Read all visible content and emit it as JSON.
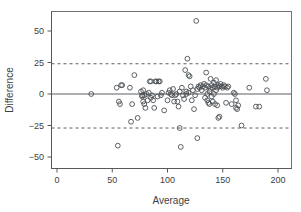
{
  "chart_data": {
    "type": "scatter",
    "title": "",
    "xlabel": "Average",
    "ylabel": "Difference",
    "xlim": [
      -5,
      207
    ],
    "ylim": [
      -57,
      66
    ],
    "xticks": [
      0,
      50,
      100,
      150,
      200
    ],
    "xtick_labels": [
      "0",
      "50",
      "100",
      "150",
      "200"
    ],
    "yticks": [
      -50,
      -25,
      0,
      25,
      50
    ],
    "ytick_labels": [
      "−50",
      "−25",
      "0",
      "25",
      "50"
    ],
    "grid": false,
    "legend": null,
    "reference_lines": [
      {
        "name": "mean-difference",
        "y": 0,
        "style": "solid",
        "label": ""
      },
      {
        "name": "upper-limit-of-agreement",
        "y": 24,
        "style": "dashed",
        "label": ""
      },
      {
        "name": "lower-limit-of-agreement",
        "y": -27,
        "style": "dashed",
        "label": ""
      }
    ],
    "marker": {
      "shape": "circle-open",
      "radius": 2.4,
      "color": "#4a4f54"
    },
    "points": [
      [
        31,
        0
      ],
      [
        54,
        5
      ],
      [
        55,
        -41
      ],
      [
        56,
        -6
      ],
      [
        57,
        -8
      ],
      [
        58,
        7
      ],
      [
        59,
        7
      ],
      [
        66,
        5
      ],
      [
        67,
        -22
      ],
      [
        68,
        -8
      ],
      [
        70,
        15
      ],
      [
        73,
        -19
      ],
      [
        76,
        2
      ],
      [
        77,
        -2
      ],
      [
        77,
        -1
      ],
      [
        78,
        -6
      ],
      [
        78,
        3
      ],
      [
        79,
        -8
      ],
      [
        79,
        -1
      ],
      [
        80,
        -11
      ],
      [
        81,
        0
      ],
      [
        82,
        -5
      ],
      [
        83,
        1
      ],
      [
        84,
        10
      ],
      [
        85,
        10
      ],
      [
        85,
        -3
      ],
      [
        86,
        -1
      ],
      [
        87,
        -5
      ],
      [
        88,
        -11
      ],
      [
        89,
        10
      ],
      [
        90,
        10
      ],
      [
        91,
        -2
      ],
      [
        92,
        10
      ],
      [
        93,
        10
      ],
      [
        94,
        -1
      ],
      [
        95,
        1
      ],
      [
        97,
        -13
      ],
      [
        100,
        -5
      ],
      [
        101,
        1
      ],
      [
        102,
        3
      ],
      [
        103,
        0
      ],
      [
        104,
        -1
      ],
      [
        105,
        4
      ],
      [
        106,
        -6
      ],
      [
        107,
        -1
      ],
      [
        108,
        0
      ],
      [
        109,
        -6
      ],
      [
        110,
        -10
      ],
      [
        111,
        2
      ],
      [
        111,
        -27
      ],
      [
        112,
        -42
      ],
      [
        113,
        5
      ],
      [
        114,
        -1
      ],
      [
        115,
        -4
      ],
      [
        116,
        19
      ],
      [
        117,
        0
      ],
      [
        117,
        2
      ],
      [
        118,
        28
      ],
      [
        119,
        15
      ],
      [
        119,
        1
      ],
      [
        120,
        14
      ],
      [
        121,
        6
      ],
      [
        122,
        -5
      ],
      [
        123,
        3
      ],
      [
        124,
        -12
      ],
      [
        125,
        -1
      ],
      [
        126,
        58
      ],
      [
        127,
        4
      ],
      [
        127,
        -35
      ],
      [
        128,
        6
      ],
      [
        129,
        5
      ],
      [
        130,
        7
      ],
      [
        131,
        3
      ],
      [
        132,
        6
      ],
      [
        133,
        8
      ],
      [
        134,
        5
      ],
      [
        134,
        -3
      ],
      [
        135,
        17
      ],
      [
        135,
        7
      ],
      [
        136,
        0
      ],
      [
        136,
        -5
      ],
      [
        137,
        6
      ],
      [
        137,
        -7
      ],
      [
        138,
        2
      ],
      [
        138,
        -8
      ],
      [
        139,
        12
      ],
      [
        139,
        4
      ],
      [
        140,
        7
      ],
      [
        140,
        -2
      ],
      [
        141,
        5
      ],
      [
        141,
        -6
      ],
      [
        142,
        9
      ],
      [
        142,
        0
      ],
      [
        143,
        6
      ],
      [
        143,
        -8
      ],
      [
        144,
        11
      ],
      [
        144,
        3
      ],
      [
        145,
        5
      ],
      [
        145,
        -9
      ],
      [
        146,
        7
      ],
      [
        146,
        -19
      ],
      [
        147,
        6
      ],
      [
        147,
        -18
      ],
      [
        148,
        8
      ],
      [
        149,
        6
      ],
      [
        150,
        5
      ],
      [
        151,
        7
      ],
      [
        152,
        6
      ],
      [
        153,
        -7
      ],
      [
        154,
        5
      ],
      [
        155,
        6
      ],
      [
        158,
        -8
      ],
      [
        160,
        1
      ],
      [
        161,
        0
      ],
      [
        162,
        -5
      ],
      [
        162,
        -11
      ],
      [
        163,
        -12
      ],
      [
        164,
        -9
      ],
      [
        167,
        -25
      ],
      [
        174,
        5
      ],
      [
        180,
        -10
      ],
      [
        183,
        -10
      ],
      [
        189,
        12
      ],
      [
        190,
        3
      ]
    ]
  },
  "colors": {
    "marker": "#4a4f54",
    "axis": "#555a5e",
    "reference": "#5a5f64",
    "frame": "#6e7478",
    "background": "#ffffff",
    "text": "#3c4043"
  }
}
